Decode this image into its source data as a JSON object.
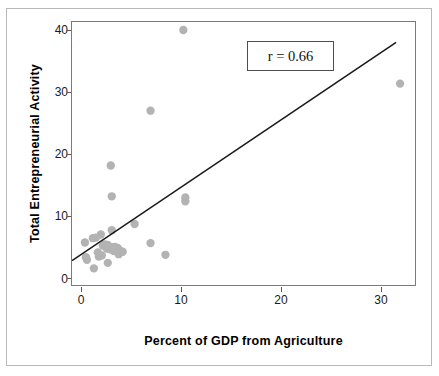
{
  "chart_data": {
    "type": "scatter",
    "title": "",
    "xlabel": "Percent of GDP from Agriculture",
    "ylabel": "Total Entrepreneurial Activity",
    "xlim": [
      -1.0,
      33.5
    ],
    "ylim": [
      -1.2,
      41.5
    ],
    "xticks": [
      0,
      10,
      20,
      30
    ],
    "xtick_labels": [
      "0",
      "10",
      "20",
      "30"
    ],
    "yticks": [
      0,
      10,
      20,
      30,
      40
    ],
    "ytick_labels": [
      "0",
      "10",
      "20",
      "30",
      "40"
    ],
    "grid": false,
    "legend": null,
    "point_color": "#b3b3b3",
    "point_radius": 4.2,
    "annotations": [
      {
        "name": "correlation-box",
        "text": "r = 0.66",
        "x_data": 21.5,
        "y_data": 36.0
      }
    ],
    "trendline": {
      "name": "regression-line",
      "color": "#1a1a1a",
      "x_start": -1.0,
      "y_start": 2.75,
      "x_end": 31.6,
      "y_end": 38.2
    },
    "points": [
      {
        "x": 0.3,
        "y": 5.7
      },
      {
        "x": 0.4,
        "y": 3.3
      },
      {
        "x": 0.5,
        "y": 2.9
      },
      {
        "x": 1.1,
        "y": 6.4
      },
      {
        "x": 1.4,
        "y": 6.5
      },
      {
        "x": 1.2,
        "y": 1.5
      },
      {
        "x": 1.6,
        "y": 4.1
      },
      {
        "x": 1.7,
        "y": 3.4
      },
      {
        "x": 1.9,
        "y": 7.0
      },
      {
        "x": 2.0,
        "y": 3.6
      },
      {
        "x": 2.1,
        "y": 5.2
      },
      {
        "x": 2.3,
        "y": 5.4
      },
      {
        "x": 2.4,
        "y": 5.1
      },
      {
        "x": 2.5,
        "y": 4.7
      },
      {
        "x": 2.6,
        "y": 5.3
      },
      {
        "x": 2.6,
        "y": 2.4
      },
      {
        "x": 2.8,
        "y": 4.6
      },
      {
        "x": 2.9,
        "y": 18.2
      },
      {
        "x": 3.0,
        "y": 13.2
      },
      {
        "x": 3.0,
        "y": 7.7
      },
      {
        "x": 3.1,
        "y": 4.9
      },
      {
        "x": 3.2,
        "y": 4.3
      },
      {
        "x": 3.3,
        "y": 5.0
      },
      {
        "x": 3.4,
        "y": 4.5
      },
      {
        "x": 3.5,
        "y": 4.4
      },
      {
        "x": 3.6,
        "y": 4.8
      },
      {
        "x": 3.7,
        "y": 3.8
      },
      {
        "x": 3.9,
        "y": 4.3
      },
      {
        "x": 4.1,
        "y": 4.2
      },
      {
        "x": 5.3,
        "y": 8.7
      },
      {
        "x": 6.9,
        "y": 5.6
      },
      {
        "x": 6.9,
        "y": 27.1
      },
      {
        "x": 8.4,
        "y": 3.7
      },
      {
        "x": 10.2,
        "y": 40.2
      },
      {
        "x": 10.4,
        "y": 13.0
      },
      {
        "x": 10.4,
        "y": 12.4
      },
      {
        "x": 32.0,
        "y": 31.5
      }
    ]
  }
}
